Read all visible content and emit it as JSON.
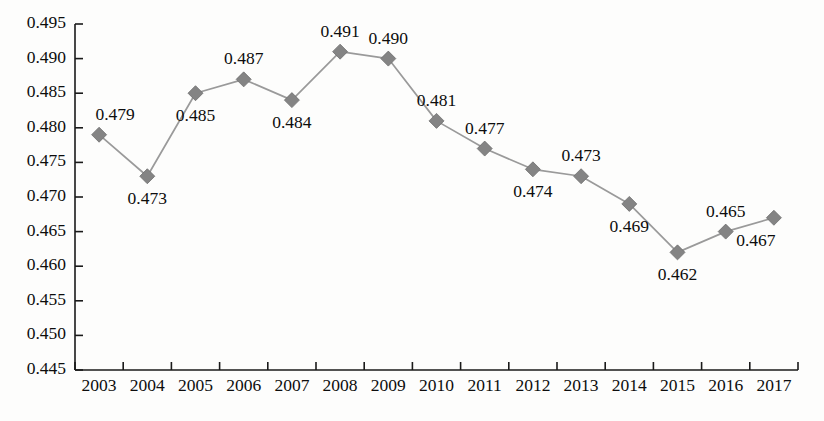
{
  "chart_data": {
    "type": "line",
    "title": "",
    "subtitle": "",
    "xlabel": "",
    "ylabel": "",
    "categories": [
      "2003",
      "2004",
      "2005",
      "2006",
      "2007",
      "2008",
      "2009",
      "2010",
      "2011",
      "2012",
      "2013",
      "2014",
      "2015",
      "2016",
      "2017"
    ],
    "values": [
      0.479,
      0.473,
      0.485,
      0.487,
      0.484,
      0.491,
      0.49,
      0.481,
      0.477,
      0.474,
      0.473,
      0.469,
      0.462,
      0.465,
      0.467
    ],
    "point_labels": [
      "0.479",
      "0.473",
      "0.485",
      "0.487",
      "0.484",
      "0.491",
      "0.490",
      "0.481",
      "0.477",
      "0.474",
      "0.473",
      "0.469",
      "0.462",
      "0.465",
      "0.467"
    ],
    "label_positions": [
      "above",
      "below",
      "below",
      "above",
      "below",
      "above",
      "above",
      "above",
      "above",
      "below",
      "above",
      "below",
      "below",
      "above",
      "below"
    ],
    "ylim": [
      0.445,
      0.495
    ],
    "ytick_step": 0.005,
    "ytick_labels": [
      "0.495",
      "0.490",
      "0.485",
      "0.480",
      "0.475",
      "0.470",
      "0.465",
      "0.460",
      "0.455",
      "0.450",
      "0.445"
    ],
    "ytick_values": [
      0.495,
      0.49,
      0.485,
      0.48,
      0.475,
      0.47,
      0.465,
      0.46,
      0.455,
      0.45,
      0.445
    ],
    "grid": false,
    "legend": null,
    "legend_position": "none",
    "marker": "diamond",
    "series": [
      {
        "name": "",
        "values": [
          0.479,
          0.473,
          0.485,
          0.487,
          0.484,
          0.491,
          0.49,
          0.481,
          0.477,
          0.474,
          0.473,
          0.469,
          0.462,
          0.465,
          0.467
        ]
      }
    ]
  },
  "colors": {
    "line": "#9a9a9a",
    "marker": "#848484",
    "axis": "#1a1a1a",
    "text": "#0d0d0d",
    "background": "#fdfdfc"
  }
}
